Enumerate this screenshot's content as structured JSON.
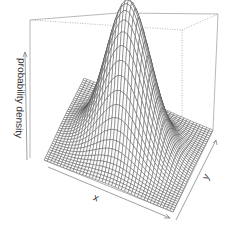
{
  "chart_data": {
    "type": "surface",
    "subtype": "persp-3d",
    "title": "",
    "xlabel": "x",
    "ylabel": "y",
    "zlabel": "probability density",
    "axes_style": "arrows (no tick labels)",
    "grid": false,
    "box": true,
    "function": "standard bivariate normal density",
    "peak": {
      "x": 0,
      "y": 0,
      "z": "max"
    },
    "surface_color": "#4a4a4a",
    "mesh_line_color": "#ffffff",
    "box_color": "#888888"
  },
  "labels": {
    "x": "x",
    "y": "y",
    "z": "probability density"
  }
}
